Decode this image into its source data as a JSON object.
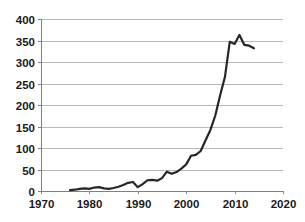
{
  "chart_data": {
    "type": "line",
    "title": "",
    "subtitle": "",
    "xlabel": "",
    "ylabel": "",
    "xlim": [
      1970,
      2020
    ],
    "ylim": [
      0,
      400
    ],
    "x_ticks": [
      1970,
      1980,
      1990,
      2000,
      2010,
      2020
    ],
    "y_ticks": [
      0,
      50,
      100,
      150,
      200,
      250,
      300,
      350,
      400
    ],
    "x_tick_labels": [
      "1970",
      "1980",
      "1990",
      "2000",
      "2010",
      "2020"
    ],
    "y_tick_labels": [
      "0",
      "50",
      "100",
      "150",
      "200",
      "250",
      "300",
      "350",
      "400"
    ],
    "grid": {
      "horizontal": true,
      "vertical": false,
      "color": "#a6a6a6"
    },
    "legend": {
      "visible": false,
      "position": "none",
      "entries": []
    },
    "annotations": [],
    "line_color": "#262626",
    "line_width": 2.2,
    "markers": false,
    "series": [
      {
        "name": "series-1",
        "color": "#262626",
        "x": [
          1976,
          1977,
          1978,
          1979,
          1980,
          1981,
          1982,
          1983,
          1984,
          1985,
          1986,
          1987,
          1988,
          1989,
          1990,
          1991,
          1992,
          1993,
          1994,
          1995,
          1996,
          1997,
          1998,
          1999,
          2000,
          2001,
          2002,
          2003,
          2004,
          2005,
          2006,
          2007,
          2008,
          2009,
          2010,
          2011,
          2012,
          2013,
          2014
        ],
        "values": [
          2,
          3,
          5,
          6,
          5,
          8,
          9,
          6,
          5,
          7,
          10,
          14,
          19,
          21,
          9,
          16,
          25,
          26,
          24,
          30,
          45,
          40,
          44,
          52,
          62,
          82,
          84,
          93,
          118,
          142,
          175,
          222,
          265,
          347,
          342,
          363,
          340,
          338,
          332
        ]
      }
    ]
  },
  "figure": {
    "background": "#ffffff",
    "plot_area": {
      "left_px": 41,
      "right_px": 283,
      "top_px": 19,
      "bottom_px": 191
    }
  }
}
